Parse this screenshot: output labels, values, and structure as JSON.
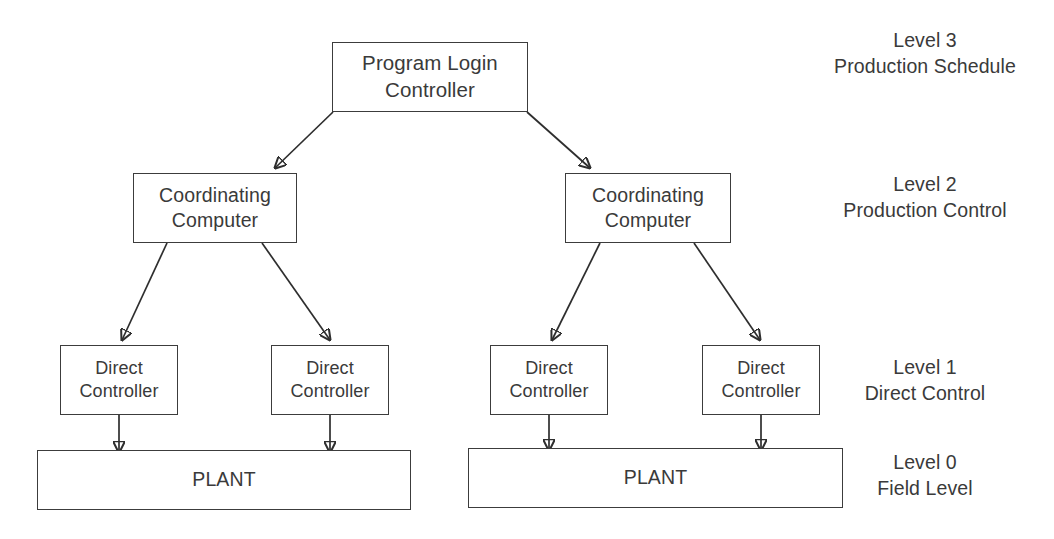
{
  "diagram": {
    "nodes": {
      "program_login_controller": "Program Login\nController",
      "coordinating_computer_left": "Coordinating\nComputer",
      "coordinating_computer_right": "Coordinating\nComputer",
      "direct_controller_1": "Direct\nController",
      "direct_controller_2": "Direct\nController",
      "direct_controller_3": "Direct\nController",
      "direct_controller_4": "Direct\nController",
      "plant_left": "PLANT",
      "plant_right": "PLANT"
    },
    "level_labels": {
      "level3": "Level 3\nProduction Schedule",
      "level2": "Level 2\nProduction Control",
      "level1": "Level 1\nDirect Control",
      "level0": "Level 0\nField Level"
    },
    "colors": {
      "line": "#2e2e2e",
      "text": "#3a3a3a",
      "background": "#ffffff"
    }
  }
}
